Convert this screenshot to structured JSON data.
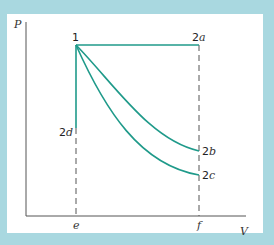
{
  "diagram": {
    "axes": {
      "y_label": "P",
      "x_label": "V"
    },
    "points": {
      "p1": "1",
      "p2a": "2",
      "p2a_sub": "a",
      "p2b": "2",
      "p2b_sub": "b",
      "p2c": "2",
      "p2c_sub": "c",
      "p2d": "2",
      "p2d_sub": "d"
    },
    "x_ticks": {
      "e": "e",
      "f": "f"
    },
    "colors": {
      "curve": "#1f9a8a",
      "axis": "#555555",
      "background": "#a9d8e0",
      "panel": "#ffffff"
    }
  }
}
